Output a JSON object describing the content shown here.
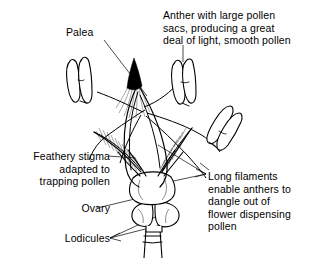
{
  "figure": {
    "background_color": "#ffffff",
    "ink_color": "#000000"
  },
  "labels": {
    "palea": "Palea",
    "anther": "Anther with large pollen\nsacs, producing a great\ndeal of light, smooth pollen",
    "stigma": "Feathery stigma\nadapted to\ntrapping pollen",
    "filaments": "Long filaments\nenable anthers to\ndangle out of\nflower dispensing\npollen",
    "ovary": "Ovary",
    "lodicules": "Lodicules"
  },
  "parts": [
    {
      "name": "palea",
      "description": "dark pointed bract at centre top"
    },
    {
      "name": "anther-left",
      "description": "two-lobed anther upper left"
    },
    {
      "name": "anther-top",
      "description": "two-lobed anther upper right"
    },
    {
      "name": "anther-right",
      "description": "two-lobed anther lower right, tilted"
    },
    {
      "name": "stigma-left",
      "description": "feathery plume angled up-left"
    },
    {
      "name": "stigma-right",
      "description": "feathery plume angled up-right"
    },
    {
      "name": "ovary",
      "description": "rounded swelling at flower base"
    },
    {
      "name": "lodicules",
      "description": "pair of fleshy lobes below ovary"
    },
    {
      "name": "pedicel",
      "description": "narrow stalk at bottom"
    }
  ]
}
